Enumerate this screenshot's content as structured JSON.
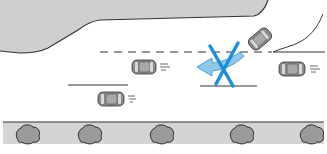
{
  "diagram": {
    "colors": {
      "background": "#ffffff",
      "curb_fill": "#cfcfcf",
      "curb_edge": "#333333",
      "road_lines": "#333333",
      "car_body": "#8a8a8a",
      "car_roof": "#a8a8a8",
      "car_window": "#d8d8d8",
      "arrow_fill": "#8fc8ea",
      "arrow_stroke": "#4aa3d8",
      "prohibit_x": "#1e8fd6",
      "sidewalk_fill": "#d4d4d4",
      "shrub_fill": "#9a9a9a",
      "shrub_edge": "#2c2c2c"
    },
    "elements": {
      "turning_car": "car-turning-into-side-road",
      "oncoming_cars": [
        "car-center-lane",
        "car-lower-lane",
        "car-right-lane"
      ],
      "prohibited_maneuver": "left-turn-arrow-crossed-out",
      "shrub_count": 5
    }
  }
}
